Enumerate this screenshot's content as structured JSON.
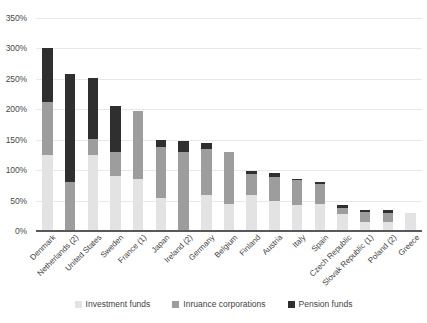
{
  "chart_data": {
    "type": "bar",
    "title": "",
    "subtitle": "",
    "xlabel": "",
    "ylabel": "",
    "stacked": true,
    "grid": true,
    "legend_position": "bottom",
    "ylim": [
      0,
      350
    ],
    "ytick_labels": [
      "0%",
      "50%",
      "100%",
      "150%",
      "200%",
      "250%",
      "300%",
      "350%"
    ],
    "ytick_values": [
      0,
      50,
      100,
      150,
      200,
      250,
      300,
      350
    ],
    "categories": [
      "Denmark",
      "Netherlands (2)",
      "United States",
      "Sweden",
      "France (1)",
      "Japan",
      "Ireland (2)",
      "Germany",
      "Belgium",
      "Finland",
      "Austria",
      "Italy",
      "Spain",
      "Czech Republic",
      "Slovak Republic (1)",
      "Poland (2)",
      "Greece"
    ],
    "series": [
      {
        "name": "Investment funds",
        "color": "#e3e3e3",
        "values": [
          125,
          0,
          125,
          90,
          85,
          55,
          0,
          60,
          45,
          60,
          50,
          42,
          45,
          28,
          14,
          15,
          30
        ]
      },
      {
        "name": "Inruance corporations",
        "color": "#9d9d9d",
        "values": [
          87,
          80,
          27,
          40,
          112,
          83,
          130,
          75,
          85,
          33,
          38,
          42,
          32,
          10,
          17,
          15,
          0
        ]
      },
      {
        "name": "Pension funds",
        "color": "#2f2f2f",
        "values": [
          88,
          178,
          100,
          75,
          0,
          12,
          18,
          10,
          0,
          5,
          7,
          1,
          3,
          4,
          4,
          5,
          0
        ]
      }
    ],
    "totals": [
      300,
      258,
      252,
      205,
      197,
      150,
      148,
      145,
      130,
      98,
      95,
      85,
      80,
      42,
      35,
      35,
      30
    ]
  },
  "legend": {
    "items": [
      {
        "label": "Investment funds",
        "color": "#e3e3e3"
      },
      {
        "label": "Inruance corporations",
        "color": "#9d9d9d"
      },
      {
        "label": "Pension funds",
        "color": "#2f2f2f"
      }
    ]
  }
}
